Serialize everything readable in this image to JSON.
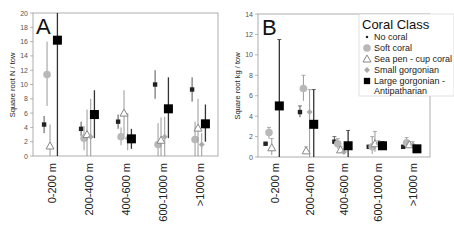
{
  "chart_data": [
    {
      "type": "scatter",
      "panel": "A",
      "title": "",
      "xlabel": "",
      "ylabel": "Square root N / tow",
      "ylim": [
        0,
        20
      ],
      "yticks": [
        0,
        2,
        4,
        6,
        8,
        10,
        12,
        14,
        16,
        18,
        20
      ],
      "grid": false,
      "categories": [
        "0-200 m",
        "200-400 m",
        "400-600 m",
        "600-1000 m",
        ">1000 m"
      ],
      "series": [
        {
          "name": "No coral",
          "marker": "small-square",
          "color": "#222222",
          "values": [
            4.4,
            3.8,
            4.8,
            10.0,
            9.3
          ],
          "err_low": [
            3.2,
            2.8,
            3.8,
            8.0,
            7.6
          ],
          "err_high": [
            5.6,
            4.8,
            5.8,
            12.0,
            11.0
          ]
        },
        {
          "name": "Soft coral",
          "marker": "circle",
          "color": "#aaaaaa",
          "values": [
            11.4,
            2.5,
            2.7,
            1.6,
            2.3
          ],
          "err_low": [
            7.0,
            0.8,
            1.5,
            0.0,
            0.0
          ],
          "err_high": [
            16.0,
            4.2,
            4.0,
            4.6,
            4.8
          ]
        },
        {
          "name": "Sea pen - cup coral",
          "marker": "triangle",
          "color": "#888888",
          "values": [
            1.4,
            3.0,
            6.0,
            2.2,
            3.9
          ],
          "err_low": [
            0.0,
            0.0,
            3.0,
            0.0,
            0.0
          ],
          "err_high": [
            4.4,
            6.5,
            9.2,
            5.4,
            8.0
          ]
        },
        {
          "name": "Small gorgonian",
          "marker": "diamond",
          "color": "#999999",
          "values": [
            null,
            2.7,
            2.5,
            2.7,
            1.6
          ],
          "err_low": [
            null,
            0.0,
            0.8,
            0.0,
            0.0
          ],
          "err_high": [
            null,
            8.0,
            6.0,
            5.5,
            3.2
          ]
        },
        {
          "name": "Large gorgonian - Antipatharian",
          "marker": "square",
          "color": "#000000",
          "values": [
            16.2,
            5.8,
            2.4,
            6.6,
            4.5
          ],
          "err_low": [
            0.0,
            2.5,
            1.0,
            2.5,
            2.0
          ],
          "err_high": [
            20.0,
            9.2,
            3.8,
            11.0,
            7.2
          ]
        }
      ]
    },
    {
      "type": "scatter",
      "panel": "B",
      "title": "",
      "xlabel": "",
      "ylabel": "Square root kg / tow",
      "ylim": [
        0,
        14
      ],
      "yticks": [
        0,
        2,
        4,
        6,
        8,
        10,
        12,
        14
      ],
      "grid": false,
      "legend_position": "upper right",
      "categories": [
        "0-200 m",
        "200-400 m",
        "400-600 m",
        "600-1000 m",
        ">1000 m"
      ],
      "series": [
        {
          "name": "No coral",
          "marker": "small-square",
          "color": "#222222",
          "values": [
            1.3,
            4.4,
            1.5,
            1.0,
            1.0
          ],
          "err_low": [
            1.3,
            3.9,
            1.2,
            0.9,
            0.9
          ],
          "err_high": [
            1.3,
            5.0,
            2.0,
            1.1,
            1.1
          ]
        },
        {
          "name": "Soft coral",
          "marker": "circle",
          "color": "#aaaaaa",
          "values": [
            2.4,
            6.7,
            1.3,
            1.0,
            1.4
          ],
          "err_low": [
            1.8,
            5.5,
            0.8,
            0.3,
            0.9
          ],
          "err_high": [
            2.9,
            8.0,
            1.8,
            2.0,
            1.9
          ]
        },
        {
          "name": "Sea pen - cup coral",
          "marker": "triangle",
          "color": "#888888",
          "values": [
            0.9,
            0.6,
            0.7,
            1.3,
            1.2
          ],
          "err_low": [
            0.2,
            0.4,
            0.4,
            0.5,
            0.9
          ],
          "err_high": [
            1.8,
            1.0,
            1.0,
            2.5,
            1.5
          ]
        },
        {
          "name": "Small gorgonian",
          "marker": "diamond",
          "color": "#999999",
          "values": [
            null,
            4.4,
            0.5,
            1.3,
            1.2
          ],
          "err_low": [
            null,
            0.0,
            0.3,
            1.0,
            0.9
          ],
          "err_high": [
            null,
            6.6,
            0.8,
            1.6,
            1.5
          ]
        },
        {
          "name": "Large gorgonian - Antipatharian",
          "marker": "square",
          "color": "#000000",
          "values": [
            5.0,
            3.2,
            1.1,
            1.1,
            0.8
          ],
          "err_low": [
            0.0,
            0.0,
            0.0,
            0.7,
            0.6
          ],
          "err_high": [
            11.5,
            6.6,
            2.6,
            1.5,
            1.0
          ]
        }
      ]
    }
  ],
  "panels": {
    "a": {
      "label": "A",
      "ylabel": "Square root N / tow",
      "yticks": [
        "0",
        "2",
        "4",
        "6",
        "8",
        "10",
        "12",
        "14",
        "16",
        "18",
        "20"
      ]
    },
    "b": {
      "label": "B",
      "ylabel": "Square root kg / tow",
      "yticks": [
        "0",
        "2",
        "4",
        "6",
        "8",
        "10",
        "12",
        "14"
      ]
    }
  },
  "categories": [
    "0-200 m",
    "200-400 m",
    "400-600 m",
    "600-1000 m",
    ">1000 m"
  ],
  "legend": {
    "title": "Coral Class",
    "items": [
      {
        "label": "No coral",
        "marker": "small-square"
      },
      {
        "label": "Soft coral",
        "marker": "circle"
      },
      {
        "label": "Sea pen - cup coral",
        "marker": "triangle"
      },
      {
        "label": "Small gorgonian",
        "marker": "diamond"
      },
      {
        "label": "Large gorgonian -",
        "label2": "Antipatharian",
        "marker": "square"
      }
    ]
  }
}
